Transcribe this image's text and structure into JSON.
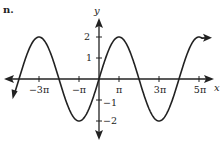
{
  "figure": {
    "label": "n."
  },
  "chart_data": {
    "type": "line",
    "title": "",
    "function": "y = 2 sin(x/2)",
    "xlabel": "x",
    "ylabel": "y",
    "x_ticks": [
      "−3π",
      "−π",
      "π",
      "3π",
      "5π"
    ],
    "x_tick_values_pi": [
      -3,
      -1,
      1,
      3,
      5
    ],
    "y_ticks": [
      "2",
      "1",
      "−1",
      "−2"
    ],
    "y_tick_values": [
      2,
      1,
      -1,
      -2
    ],
    "xlim_pi": [
      -4.3,
      5.6
    ],
    "ylim": [
      -2.5,
      2.5
    ],
    "grid": false,
    "series": [
      {
        "name": "curve",
        "amplitude": 2,
        "period_pi": 4,
        "points": [
          {
            "x_pi": -4.2,
            "y": -0.6
          },
          {
            "x_pi": -4,
            "y": 0
          },
          {
            "x_pi": -3,
            "y": 2
          },
          {
            "x_pi": -2,
            "y": 0
          },
          {
            "x_pi": -1,
            "y": -2
          },
          {
            "x_pi": 0,
            "y": 0
          },
          {
            "x_pi": 1,
            "y": 2
          },
          {
            "x_pi": 2,
            "y": 0
          },
          {
            "x_pi": 3,
            "y": -2
          },
          {
            "x_pi": 4,
            "y": 0
          },
          {
            "x_pi": 5,
            "y": 2
          }
        ]
      }
    ],
    "colors": {
      "ink": "#222222",
      "background": "#ffffff"
    }
  }
}
